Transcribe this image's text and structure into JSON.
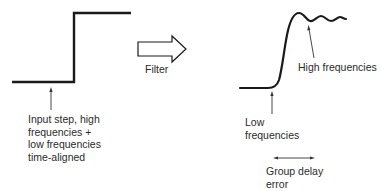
{
  "diagram": {
    "input": {
      "label_lines": [
        "Input step, high",
        "frequencies +",
        "low frequencies",
        "time-aligned"
      ]
    },
    "filter": {
      "label": "Filter"
    },
    "output": {
      "high_freq_label": "High frequencies",
      "low_freq_label_lines": [
        "Low",
        "frequencies"
      ],
      "group_delay_label_lines": [
        "Group delay",
        "error"
      ]
    },
    "colors": {
      "line": "#1a1a1a",
      "text": "#2a2a2a",
      "background": "#ffffff"
    }
  }
}
